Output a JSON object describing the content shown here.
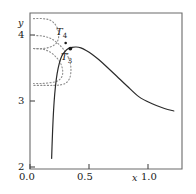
{
  "chart_data": {
    "type": "line",
    "title": "",
    "xlabel": "x",
    "ylabel": "y",
    "xlim": [
      -0.05,
      1.25
    ],
    "ylim": [
      1.85,
      4.35
    ],
    "grid": false,
    "legend_position": "none",
    "x_ticks": [
      {
        "value": 0.0,
        "label": "0.0"
      },
      {
        "value": 0.5,
        "label": "0.5"
      },
      {
        "value": 1.0,
        "label": "1.0"
      }
    ],
    "y_ticks": [
      {
        "value": 2,
        "label": "2"
      },
      {
        "value": 3,
        "label": "3"
      },
      {
        "value": 4,
        "label": "4"
      }
    ],
    "annotations": [
      {
        "text": "T",
        "sub": "4",
        "x": 0.25,
        "y": 3.95
      },
      {
        "text": "T",
        "sub": "3",
        "x": 0.31,
        "y": 3.62
      }
    ],
    "markers": [
      {
        "name": "t4-point",
        "x": 0.255,
        "y": 3.87
      },
      {
        "name": "t3-point",
        "x": 0.295,
        "y": 3.78
      }
    ],
    "series": [
      {
        "name": "solid-curve",
        "style": "solid",
        "points": [
          [
            0.135,
            2.02
          ],
          [
            0.14,
            2.3
          ],
          [
            0.147,
            2.62
          ],
          [
            0.156,
            2.92
          ],
          [
            0.168,
            3.18
          ],
          [
            0.182,
            3.38
          ],
          [
            0.2,
            3.54
          ],
          [
            0.222,
            3.66
          ],
          [
            0.248,
            3.73
          ],
          [
            0.278,
            3.78
          ],
          [
            0.31,
            3.8
          ],
          [
            0.345,
            3.805
          ],
          [
            0.385,
            3.79
          ],
          [
            0.43,
            3.75
          ],
          [
            0.48,
            3.69
          ],
          [
            0.54,
            3.6
          ],
          [
            0.61,
            3.48
          ],
          [
            0.69,
            3.34
          ],
          [
            0.78,
            3.18
          ],
          [
            0.88,
            3.01
          ],
          [
            0.99,
            2.9
          ],
          [
            1.1,
            2.82
          ],
          [
            1.18,
            2.78
          ]
        ]
      },
      {
        "name": "isotherm-upper",
        "style": "dotted",
        "points": [
          [
            -0.02,
            4.26
          ],
          [
            0.055,
            4.26
          ],
          [
            0.115,
            4.24
          ],
          [
            0.16,
            4.18
          ],
          [
            0.188,
            4.09
          ],
          [
            0.196,
            3.99
          ],
          [
            0.186,
            3.9
          ],
          [
            0.16,
            3.84
          ],
          [
            0.115,
            3.8
          ],
          [
            0.055,
            3.78
          ],
          [
            -0.02,
            3.78
          ]
        ]
      },
      {
        "name": "isotherm-middle",
        "style": "dotted",
        "points": [
          [
            -0.02,
            3.99
          ],
          [
            0.06,
            3.98
          ],
          [
            0.13,
            3.94
          ],
          [
            0.19,
            3.86
          ],
          [
            0.24,
            3.76
          ],
          [
            0.275,
            3.65
          ],
          [
            0.296,
            3.53
          ],
          [
            0.3,
            3.41
          ],
          [
            0.288,
            3.3
          ],
          [
            0.258,
            3.23
          ],
          [
            0.215,
            3.2
          ],
          [
            0.15,
            3.19
          ],
          [
            0.07,
            3.19
          ],
          [
            -0.02,
            3.19
          ]
        ]
      },
      {
        "name": "isotherm-lower",
        "style": "dotted",
        "points": [
          [
            -0.02,
            3.78
          ],
          [
            0.06,
            3.77
          ],
          [
            0.125,
            3.72
          ],
          [
            0.175,
            3.64
          ],
          [
            0.21,
            3.55
          ],
          [
            0.228,
            3.45
          ],
          [
            0.228,
            3.36
          ],
          [
            0.208,
            3.29
          ],
          [
            0.17,
            3.25
          ],
          [
            0.11,
            3.23
          ],
          [
            0.04,
            3.22
          ],
          [
            -0.02,
            3.22
          ]
        ]
      }
    ],
    "colors": {
      "curve": "#2b2b2b",
      "isotherm": "#8c8c8c",
      "axis": "#555555",
      "text": "#1a1a1a",
      "background": "#ffffff"
    }
  },
  "axes": {
    "x_name": "x",
    "y_name": "y",
    "x_tick_labels": [
      "0.0",
      "0.5",
      "1.0"
    ],
    "y_tick_labels": [
      "2",
      "3",
      "4"
    ]
  },
  "labels": {
    "t4": {
      "base": "T",
      "sub": "4"
    },
    "t3": {
      "base": "T",
      "sub": "3"
    }
  }
}
